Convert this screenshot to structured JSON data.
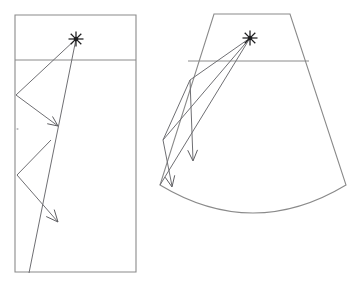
{
  "figure": {
    "background_color": "#ffffff",
    "outline_color": "#8a8a8a",
    "ray_color": "#6f6f73",
    "source_color": "#1d1d1f",
    "panels": [
      {
        "id": "left-panel",
        "name": "rectangular-room",
        "shape": "rectangle",
        "label": "",
        "outline_points": "15,15 136,15 136,272 15,272",
        "divider": {
          "x1": 15,
          "y1": 60,
          "x2": 136,
          "y2": 60
        },
        "source": {
          "x": 76,
          "y": 39,
          "marker": "asterisk-star",
          "rays": 8,
          "radius": 7.5
        },
        "ray_paths": [
          {
            "name": "ray-path-a",
            "points": "76,39 16,95 58,126"
          },
          {
            "name": "ray-path-b",
            "points": "76,39 29,273"
          },
          {
            "name": "ray-path-c",
            "points": "17,175 58,222"
          },
          {
            "name": "ray-path-d",
            "points": "51,140 17,175"
          }
        ],
        "arrow_heads": [
          {
            "name": "arrow-head-a",
            "tip_x": 58,
            "tip_y": 126,
            "angle_deg": 36,
            "size": 11
          },
          {
            "name": "arrow-head-b",
            "tip_x": 58,
            "tip_y": 222,
            "angle_deg": 49,
            "size": 13
          }
        ],
        "specks": [
          {
            "x": 17.5,
            "y": 129,
            "r": 1.1
          }
        ]
      },
      {
        "id": "right-panel",
        "name": "fan-shaped-room",
        "shape": "trapezoid-with-arc-base",
        "label": "",
        "outline_points": "214,14 290,14 346,185 160,185",
        "arc": {
          "start_x": 160,
          "start_y": 185,
          "end_x": 346,
          "end_y": 185,
          "sag": 28
        },
        "divider": {
          "x1": 188,
          "y1": 61,
          "x2": 309,
          "y2": 61
        },
        "source": {
          "x": 250,
          "y": 38,
          "marker": "asterisk-star",
          "rays": 8,
          "radius": 7.5
        },
        "ray_paths": [
          {
            "name": "ray-path-e",
            "points": "250,38 190,80 193,160"
          },
          {
            "name": "ray-path-f",
            "points": "250,38 163,140 172,186"
          },
          {
            "name": "ray-path-g",
            "points": "190,80 163,140"
          },
          {
            "name": "ray-path-h",
            "points": "250,38 160,185"
          }
        ],
        "arrow_heads": [
          {
            "name": "arrow-head-c",
            "tip_x": 193,
            "tip_y": 161,
            "angle_deg": 88,
            "size": 12
          },
          {
            "name": "arrow-head-d",
            "tip_x": 172,
            "tip_y": 187,
            "angle_deg": 79,
            "size": 12
          }
        ],
        "specks": []
      }
    ]
  },
  "caption": {
    "text": "",
    "visible_fragment": "",
    "note": ""
  }
}
